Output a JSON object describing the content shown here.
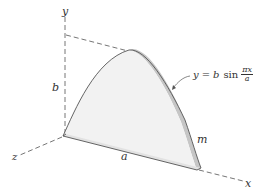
{
  "figure": {
    "type": "3D mechanics diagram",
    "axes": {
      "x_label": "x",
      "y_label": "y",
      "z_label": "z"
    },
    "dimensions": {
      "height_label": "b",
      "base_label": "a",
      "thickness_label": "m"
    },
    "equation": {
      "lhs": "y",
      "eq": "=",
      "coef": "b",
      "func": "sin",
      "num": "πx",
      "den": "a"
    },
    "colors": {
      "face": "#f1f1f1",
      "edge_shade": "#bdbdbd",
      "outline": "#555555",
      "dash": "#666666",
      "text": "#333333"
    }
  }
}
